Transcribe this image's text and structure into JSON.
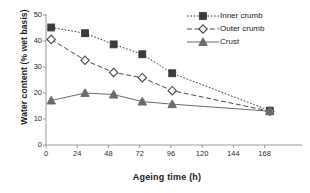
{
  "chart_data": {
    "type": "line",
    "title": "",
    "xlabel": "Ageing time (h)",
    "ylabel": "Water content (% wet basis)",
    "xlim": [
      0,
      186
    ],
    "ylim": [
      0,
      50
    ],
    "xticks": [
      0,
      24,
      48,
      72,
      96,
      120,
      144,
      168
    ],
    "yticks": [
      0,
      10,
      20,
      30,
      40,
      50
    ],
    "grid": false,
    "legend_position": "top-right",
    "x": [
      4,
      30,
      52,
      74,
      97,
      172
    ],
    "series": [
      {
        "name": "Inner crumb",
        "marker": "filled-square",
        "line_style": "dotted",
        "color": "#3b3b3b",
        "values": [
          45.2,
          43.0,
          38.7,
          34.9,
          27.6,
          13.2
        ],
        "errors": [
          0.5,
          0.4,
          0.4,
          0.5,
          0.5,
          0.4
        ]
      },
      {
        "name": "Outer crumb",
        "marker": "open-diamond",
        "line_style": "dashed",
        "color": "#4a4a4a",
        "values": [
          40.6,
          32.6,
          27.9,
          25.9,
          20.9,
          13.0
        ],
        "errors": [
          0.6,
          0.7,
          0.6,
          0.6,
          0.6,
          0.4
        ]
      },
      {
        "name": "Crust",
        "marker": "filled-triangle",
        "line_style": "solid",
        "color": "#6b6b6b",
        "values": [
          17.1,
          20.0,
          19.4,
          16.7,
          15.7,
          13.0
        ],
        "errors": [
          0.6,
          0.6,
          0.5,
          0.7,
          0.6,
          0.4
        ]
      }
    ],
    "ytick_labels": [
      "0",
      "10",
      "20",
      "30",
      "40",
      "50"
    ],
    "xtick_labels": [
      "0",
      "24",
      "48",
      "72",
      "96",
      "120",
      "144",
      "168"
    ]
  },
  "legend": {
    "items": [
      {
        "label": "Inner crumb"
      },
      {
        "label": "Outer crumb"
      },
      {
        "label": "Crust"
      }
    ]
  },
  "axis": {
    "x_title": "Ageing time (h)",
    "y_title": "Water content (% wet basis)"
  },
  "colors": {
    "axis": "#9a9a9a",
    "inner_crumb": "#3b3b3b",
    "outer_crumb": "#4a4a4a",
    "crust": "#6b6b6b",
    "text": "#1a1a1a",
    "background": "#ffffff"
  }
}
